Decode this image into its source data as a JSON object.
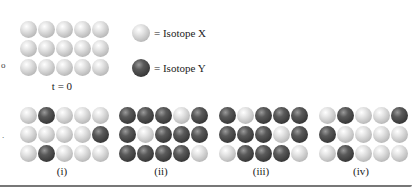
{
  "figure": {
    "initial": {
      "caption": "t = 0",
      "rows": [
        [
          "L",
          "L",
          "L",
          "L",
          "L"
        ],
        [
          "L",
          "L",
          "L",
          "L",
          "L"
        ],
        [
          "L",
          "L",
          "L",
          "L",
          "L"
        ]
      ]
    },
    "legend": [
      {
        "type": "L",
        "label": "= Isotope X"
      },
      {
        "type": "D",
        "label": "= Isotope Y"
      }
    ],
    "options": [
      {
        "caption": "(i)",
        "rows": [
          [
            "L",
            "D",
            "L",
            "L",
            "L"
          ],
          [
            "L",
            "L",
            "L",
            "L",
            "D"
          ],
          [
            "L",
            "D",
            "L",
            "L",
            "L"
          ]
        ]
      },
      {
        "caption": "(ii)",
        "rows": [
          [
            "D",
            "D",
            "D",
            "L",
            "D"
          ],
          [
            "D",
            "L",
            "D",
            "D",
            "D"
          ],
          [
            "D",
            "D",
            "D",
            "D",
            "L"
          ]
        ]
      },
      {
        "caption": "(iii)",
        "rows": [
          [
            "D",
            "L",
            "D",
            "D",
            "D"
          ],
          [
            "D",
            "D",
            "D",
            "L",
            "D"
          ],
          [
            "L",
            "D",
            "D",
            "D",
            "L"
          ]
        ]
      },
      {
        "caption": "(iv)",
        "rows": [
          [
            "L",
            "D",
            "L",
            "L",
            "D"
          ],
          [
            "D",
            "L",
            "L",
            "L",
            "L"
          ],
          [
            "L",
            "D",
            "L",
            "L",
            "L"
          ]
        ]
      }
    ],
    "left_marks": [
      "o",
      "."
    ]
  }
}
